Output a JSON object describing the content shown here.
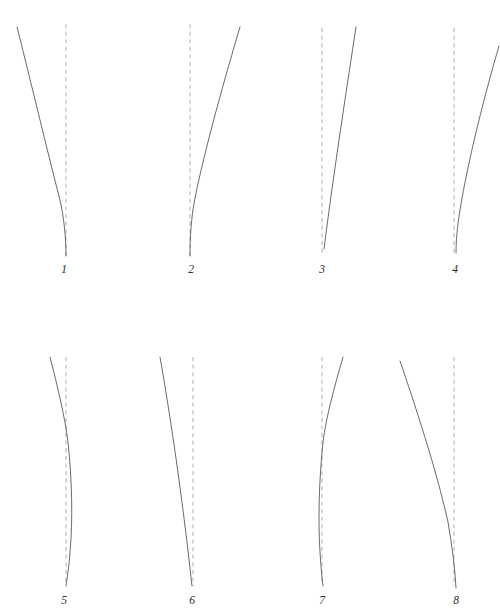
{
  "plate": {
    "title": "Plate of eight curve figures",
    "background_color": "#ffffff",
    "curve_color": "#5a5a5a",
    "axis_color": "#b4b4b4",
    "label_color": "#2a2a2a",
    "width": 500,
    "height": 616,
    "rows": 2,
    "columns": 4
  },
  "chart_data": {
    "type": "line",
    "title": "",
    "subtitle": "",
    "xlabel": "",
    "ylabel": "",
    "grid": false,
    "legend_position": "none",
    "panel_count": 8,
    "panel_layout": "2 rows x 4 columns",
    "shared_description": "Each panel shows one solid curve beside a vertical dashed reference line.",
    "panels": [
      {
        "label": "1",
        "label_x": 64,
        "label_y": 272,
        "axis": {
          "x": 66,
          "y_top": 24,
          "y_bottom": 256,
          "style": "dashed",
          "color": "#b4b4b4"
        },
        "curve": {
          "style": "solid",
          "color": "#5a5a5a",
          "shape": "concave-right tapering to axis",
          "path": "M 17 27 C 30 78, 47 150, 60 200 C 64 218, 66 238, 66 256",
          "start": [
            17,
            27
          ],
          "end": [
            66,
            256
          ]
        }
      },
      {
        "label": "2",
        "label_x": 191,
        "label_y": 272,
        "axis": {
          "x": 190,
          "y_top": 24,
          "y_bottom": 256,
          "style": "dashed",
          "color": "#b4b4b4"
        },
        "curve": {
          "style": "solid",
          "color": "#5a5a5a",
          "shape": "concave-left tapering to axis",
          "path": "M 240 27 C 226 74, 205 148, 195 198 C 191 218, 190 238, 190 256",
          "start": [
            240,
            27
          ],
          "end": [
            190,
            256
          ]
        }
      },
      {
        "label": "3",
        "label_x": 322,
        "label_y": 272,
        "axis": {
          "x": 322,
          "y_top": 28,
          "y_bottom": 256,
          "style": "dashed",
          "color": "#b4b4b4"
        },
        "curve": {
          "style": "solid",
          "color": "#5a5a5a",
          "shape": "near-straight slanted line",
          "path": "M 356 27 C 348 80, 334 170, 324 249",
          "start": [
            356,
            27
          ],
          "end": [
            324,
            249
          ]
        }
      },
      {
        "label": "4",
        "label_x": 455,
        "label_y": 272,
        "axis": {
          "x": 454,
          "y_top": 28,
          "y_bottom": 256,
          "style": "dashed",
          "color": "#b4b4b4"
        },
        "curve": {
          "style": "solid",
          "color": "#5a5a5a",
          "shape": "concave-left tapering toward axis",
          "path": "M 499 46 C 486 90, 468 160, 460 210 C 457 228, 456 242, 456 253",
          "start": [
            499,
            46
          ],
          "end": [
            456,
            253
          ]
        }
      },
      {
        "label": "5",
        "label_x": 64,
        "label_y": 603,
        "axis": {
          "x": 66,
          "y_top": 357,
          "y_bottom": 582,
          "style": "dashed",
          "color": "#b4b4b4"
        },
        "curve": {
          "style": "solid",
          "color": "#5a5a5a",
          "shape": "crosses axis then bows right and returns",
          "path": "M 50 357 C 58 388, 65 418, 68 442 C 72 480, 73 520, 70 552 C 69 568, 67 578, 66 586",
          "start": [
            50,
            357
          ],
          "end": [
            66,
            586
          ]
        }
      },
      {
        "label": "6",
        "label_x": 192,
        "label_y": 603,
        "axis": {
          "x": 193,
          "y_top": 357,
          "y_bottom": 586,
          "style": "dashed",
          "color": "#b4b4b4"
        },
        "curve": {
          "style": "solid",
          "color": "#5a5a5a",
          "shape": "near-straight slanted line converging on axis",
          "path": "M 160 357 C 170 414, 182 494, 192 586",
          "start": [
            160,
            357
          ],
          "end": [
            192,
            586
          ]
        }
      },
      {
        "label": "7",
        "label_x": 322,
        "label_y": 603,
        "axis": {
          "x": 322,
          "y_top": 357,
          "y_bottom": 582,
          "style": "dashed",
          "color": "#b4b4b4"
        },
        "curve": {
          "style": "solid",
          "color": "#5a5a5a",
          "shape": "crosses axis then bows left and returns",
          "path": "M 343 357 C 334 388, 326 418, 323 442 C 319 480, 318 520, 320 552 C 321 568, 322 578, 323 586",
          "start": [
            343,
            357
          ],
          "end": [
            323,
            586
          ]
        }
      },
      {
        "label": "8",
        "label_x": 456,
        "label_y": 603,
        "axis": {
          "x": 454,
          "y_top": 357,
          "y_bottom": 586,
          "style": "dashed",
          "color": "#b4b4b4"
        },
        "curve": {
          "style": "solid",
          "color": "#5a5a5a",
          "shape": "concave-right tapering to axis",
          "path": "M 400 361 C 414 402, 436 468, 448 522 C 452 546, 455 568, 456 588",
          "start": [
            400,
            361
          ],
          "end": [
            456,
            588
          ]
        }
      }
    ]
  }
}
